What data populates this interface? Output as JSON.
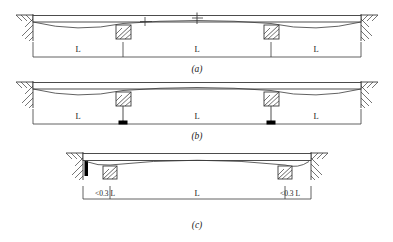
{
  "figure": {
    "type": "structural-engineering-line-diagram",
    "stroke_color": "#3a3a3a",
    "fill_color": "#000000",
    "background": "#ffffff"
  },
  "diagrams": [
    {
      "id": "a",
      "caption": "(a)",
      "end_condition": "fixed-wall-hatched-both-ends",
      "interior_supports": 2,
      "interior_support_type": "hatched-square-bearing",
      "dimension_labels": [
        "L",
        "L",
        "L"
      ],
      "span_count": 3,
      "has_midspan_ticks": true,
      "dimension_tick_style": "plain"
    },
    {
      "id": "b",
      "caption": "(b)",
      "end_condition": "fixed-wall-hatched-both-ends",
      "interior_supports": 2,
      "interior_support_type": "hatched-square-bearing-on-stem",
      "dimension_labels": [
        "L",
        "L",
        "L"
      ],
      "span_count": 3,
      "has_midspan_ticks": false,
      "dimension_tick_style": "filled-block"
    },
    {
      "id": "c",
      "caption": "(c)",
      "end_condition": "fixed-wall-hatched-both-ends",
      "interior_supports": 2,
      "interior_support_type": "hatched-square-bearing",
      "dimension_labels": [
        "<0.3 L",
        "L",
        "<0.3 L"
      ],
      "span_count": 3,
      "has_midspan_ticks": false,
      "dimension_tick_style": "plain",
      "has_end_stiffener": true
    }
  ],
  "labels": {
    "span_L": "L",
    "span_short": "<0.3 L",
    "caption_a": "(a)",
    "caption_b": "(b)",
    "caption_c": "(c)"
  }
}
